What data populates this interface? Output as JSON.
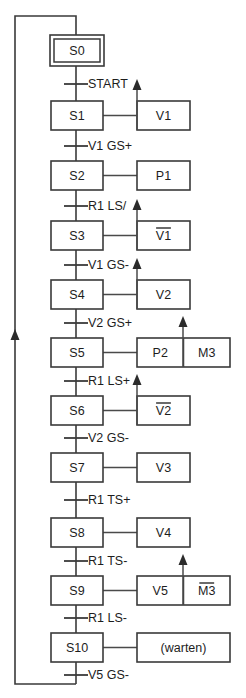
{
  "diagram": {
    "type": "sequential-function-chart",
    "title": "",
    "language": "de",
    "colors": {
      "line": "#3a3a3a",
      "text": "#1d1d1d",
      "background": "#ffffff",
      "arrow": "#2b2b2b"
    },
    "steps": [
      {
        "id": "s0",
        "label": "S0",
        "initial": true,
        "x": 50,
        "y": 35,
        "w": 54,
        "h": 31
      },
      {
        "id": "s1",
        "label": "S1",
        "initial": false,
        "x": 51,
        "y": 101,
        "w": 52,
        "h": 29
      },
      {
        "id": "s2",
        "label": "S2",
        "initial": false,
        "x": 51,
        "y": 161,
        "w": 52,
        "h": 29
      },
      {
        "id": "s3",
        "label": "S3",
        "initial": false,
        "x": 51,
        "y": 221,
        "w": 52,
        "h": 29
      },
      {
        "id": "s4",
        "label": "S4",
        "initial": false,
        "x": 51,
        "y": 280,
        "w": 52,
        "h": 29
      },
      {
        "id": "s5",
        "label": "S5",
        "initial": false,
        "x": 51,
        "y": 338,
        "w": 52,
        "h": 29
      },
      {
        "id": "s6",
        "label": "S6",
        "initial": false,
        "x": 51,
        "y": 396,
        "w": 52,
        "h": 29
      },
      {
        "id": "s7",
        "label": "S7",
        "initial": false,
        "x": 51,
        "y": 453,
        "w": 52,
        "h": 29
      },
      {
        "id": "s8",
        "label": "S8",
        "initial": false,
        "x": 51,
        "y": 518,
        "w": 52,
        "h": 29
      },
      {
        "id": "s9",
        "label": "S9",
        "initial": false,
        "x": 51,
        "y": 576,
        "w": 52,
        "h": 29
      },
      {
        "id": "s10",
        "label": "S10",
        "initial": false,
        "x": 51,
        "y": 633,
        "w": 52,
        "h": 29
      }
    ],
    "transitions": [
      {
        "id": "t0",
        "label": "START",
        "y": 84,
        "text_x": 88
      },
      {
        "id": "t1",
        "label": "V1 GS+",
        "y": 146,
        "text_x": 88
      },
      {
        "id": "t2",
        "label": "R1 LS/",
        "y": 206,
        "text_x": 88
      },
      {
        "id": "t3",
        "label": "V1 GS-",
        "y": 265,
        "text_x": 88
      },
      {
        "id": "t4",
        "label": "V2 GS+",
        "y": 323,
        "text_x": 88
      },
      {
        "id": "t5",
        "label": "R1 LS+",
        "y": 381,
        "text_x": 88
      },
      {
        "id": "t6",
        "label": "V2 GS-",
        "y": 438,
        "text_x": 88
      },
      {
        "id": "t7",
        "label": "R1 TS+",
        "y": 500,
        "text_x": 88
      },
      {
        "id": "t8",
        "label": "R1 TS-",
        "y": 561,
        "text_x": 88
      },
      {
        "id": "t9",
        "label": "R1 LS-",
        "y": 618,
        "text_x": 88
      },
      {
        "id": "t10",
        "label": "V5 GS-",
        "y": 675,
        "text_x": 88
      }
    ],
    "actions": [
      {
        "id": "a1",
        "step": "s1",
        "label": "V1",
        "negated": false,
        "x": 137,
        "y": 101,
        "w": 53,
        "h": 29,
        "arrow": true,
        "arrow_x": 137,
        "second": null
      },
      {
        "id": "a2",
        "step": "s2",
        "label": "P1",
        "negated": false,
        "x": 137,
        "y": 161,
        "w": 53,
        "h": 29,
        "arrow": false,
        "arrow_x": 0,
        "second": null
      },
      {
        "id": "a3",
        "step": "s3",
        "label": "V1",
        "negated": true,
        "x": 137,
        "y": 221,
        "w": 53,
        "h": 29,
        "arrow": true,
        "arrow_x": 137,
        "second": null
      },
      {
        "id": "a4",
        "step": "s4",
        "label": "V2",
        "negated": false,
        "x": 137,
        "y": 280,
        "w": 53,
        "h": 29,
        "arrow": true,
        "arrow_x": 137,
        "second": null
      },
      {
        "id": "a5",
        "step": "s5",
        "label": "P2",
        "negated": false,
        "x": 137,
        "y": 338,
        "w": 93,
        "h": 29,
        "arrow": true,
        "arrow_x": 183,
        "second": {
          "label": "M3",
          "negated": false
        }
      },
      {
        "id": "a6",
        "step": "s6",
        "label": "V2",
        "negated": true,
        "x": 137,
        "y": 396,
        "w": 53,
        "h": 29,
        "arrow": true,
        "arrow_x": 137,
        "second": null
      },
      {
        "id": "a7",
        "step": "s7",
        "label": "V3",
        "negated": false,
        "x": 137,
        "y": 453,
        "w": 53,
        "h": 29,
        "arrow": false,
        "arrow_x": 0,
        "second": null
      },
      {
        "id": "a8",
        "step": "s8",
        "label": "V4",
        "negated": false,
        "x": 137,
        "y": 518,
        "w": 53,
        "h": 29,
        "arrow": false,
        "arrow_x": 0,
        "second": null
      },
      {
        "id": "a9",
        "step": "s9",
        "label": "V5",
        "negated": false,
        "x": 137,
        "y": 576,
        "w": 93,
        "h": 29,
        "arrow": true,
        "arrow_x": 183,
        "second": {
          "label": "M3",
          "negated": true
        }
      },
      {
        "id": "a10",
        "step": "s10",
        "label": "(warten)",
        "negated": false,
        "x": 137,
        "y": 633,
        "w": 93,
        "h": 29,
        "arrow": false,
        "arrow_x": 0,
        "second": null
      }
    ],
    "return_loop": {
      "top_y": 16,
      "bottom_y": 684,
      "left_x": 15,
      "right_x": 76,
      "arrow_y": 338,
      "description": "loop back from last transition to initial step"
    }
  }
}
